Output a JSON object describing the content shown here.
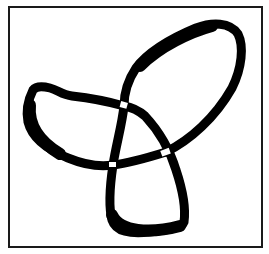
{
  "figure": {
    "colors": {
      "stroke": "#000000",
      "background": "#ffffff",
      "frame": "#1a1a1a",
      "crossing_gap": "#ffffff"
    },
    "lobes": [
      "left",
      "top-right",
      "bottom"
    ],
    "crossings": [
      {
        "name": "top",
        "x": 124,
        "y": 106
      },
      {
        "name": "right",
        "x": 166,
        "y": 152
      },
      {
        "name": "bottom-left",
        "x": 113,
        "y": 165
      }
    ]
  }
}
